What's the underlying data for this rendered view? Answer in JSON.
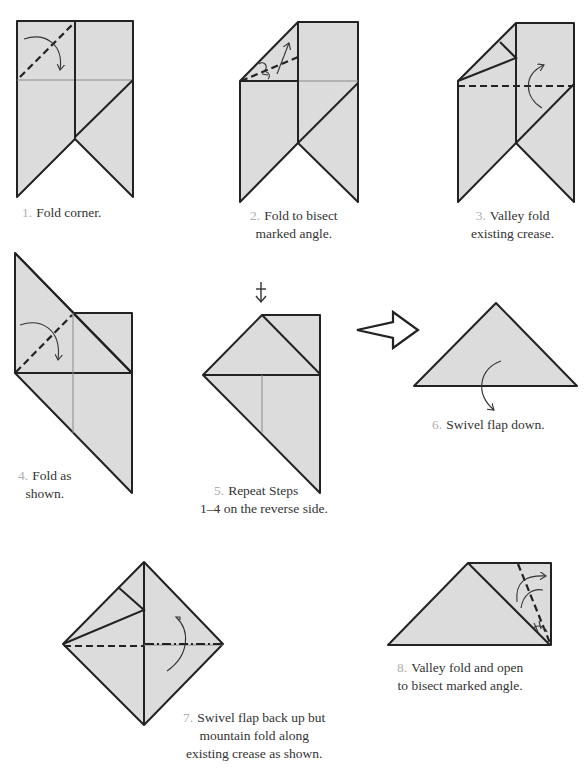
{
  "document": {
    "type": "origami instruction diagrams",
    "colors": {
      "paper": "#dcdcdc",
      "line": "#222222",
      "step_number": "#b0b0b0",
      "caption": "#333333"
    }
  },
  "steps": [
    {
      "number": "1.",
      "text_lines": [
        "Fold corner."
      ],
      "symbols": [
        "valley-fold",
        "fold-arrow"
      ]
    },
    {
      "number": "2.",
      "text_lines": [
        "Fold to bisect",
        "marked angle."
      ],
      "symbols": [
        "valley-fold",
        "fold-arrow",
        "angle-bisect-marks"
      ]
    },
    {
      "number": "3.",
      "text_lines": [
        "Valley fold",
        "existing crease."
      ],
      "symbols": [
        "valley-fold",
        "fold-arrow"
      ]
    },
    {
      "number": "4.",
      "text_lines": [
        "Fold as",
        "shown."
      ],
      "symbols": [
        "valley-fold",
        "fold-arrow"
      ]
    },
    {
      "number": "5.",
      "text_lines": [
        "Repeat Steps",
        "1–4 on the reverse side."
      ],
      "symbols": [
        "repeat-behind-arrow"
      ]
    },
    {
      "number": "6.",
      "text_lines": [
        "Swivel flap down."
      ],
      "symbols": [
        "next-view-arrow",
        "swivel-arrow"
      ]
    },
    {
      "number": "7.",
      "text_lines": [
        "Swivel flap back up but",
        "mountain fold along",
        "existing crease as shown."
      ],
      "symbols": [
        "valley-fold",
        "mountain-fold",
        "swivel-arrow"
      ]
    },
    {
      "number": "8.",
      "text_lines": [
        "Valley fold and open",
        "to bisect marked angle."
      ],
      "symbols": [
        "valley-fold",
        "fold-arrow",
        "angle-bisect-marks"
      ]
    }
  ]
}
